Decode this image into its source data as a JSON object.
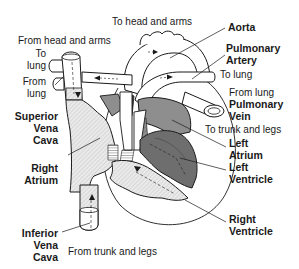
{
  "diagram": {
    "structures": [
      {
        "key": "aorta",
        "label": "Aorta"
      },
      {
        "key": "pulmonary_artery",
        "label": "Pulmonary Artery"
      },
      {
        "key": "pulmonary_vein",
        "label": "Pulmonary Vein"
      },
      {
        "key": "superior_vena_cava",
        "label": "Superior Vena Cava"
      },
      {
        "key": "right_atrium",
        "label": "Right Atrium"
      },
      {
        "key": "left_atrium",
        "label": "Left Atrium"
      },
      {
        "key": "left_ventricle",
        "label": "Left Ventricle"
      },
      {
        "key": "right_ventricle",
        "label": "Right Ventricle"
      },
      {
        "key": "inferior_vena_cava",
        "label": "Inferior Vena Cava"
      }
    ],
    "flow_labels": {
      "to_head_arms": "To head and arms",
      "from_head_arms": "From head and arms",
      "to_lung_left_1": "To",
      "to_lung_left_2": "lung",
      "from_lung_left_1": "From",
      "from_lung_left_2": "lung",
      "to_lung_right": "To lung",
      "from_lung_right": "From lung",
      "to_trunk_legs": "To trunk and legs",
      "from_trunk_legs": "From trunk and legs"
    },
    "labels": {
      "aorta": "Aorta",
      "pulmonary_1": "Pulmonary",
      "artery": "Artery",
      "pulmonary_2": "Pulmonary",
      "vein": "Vein",
      "superior": "Superior",
      "vena_1": "Vena",
      "cava_1": "Cava",
      "right_1": "Right",
      "atrium_1": "Atrium",
      "left_1": "Left",
      "atrium_2": "Atrium",
      "left_2": "Left",
      "ventricle_1": "Ventricle",
      "right_2": "Right",
      "ventricle_2": "Ventricle",
      "inferior": "Inferior",
      "vena_2": "Vena",
      "cava_2": "Cava"
    },
    "colors": {
      "outline": "#1a1a1a",
      "deoxygenated_fill": "#e4e4e4",
      "oxygenated_fill": "#8a8a8a",
      "dark_fill": "#4a4a4a",
      "vessel_fill": "#ffffff"
    }
  }
}
